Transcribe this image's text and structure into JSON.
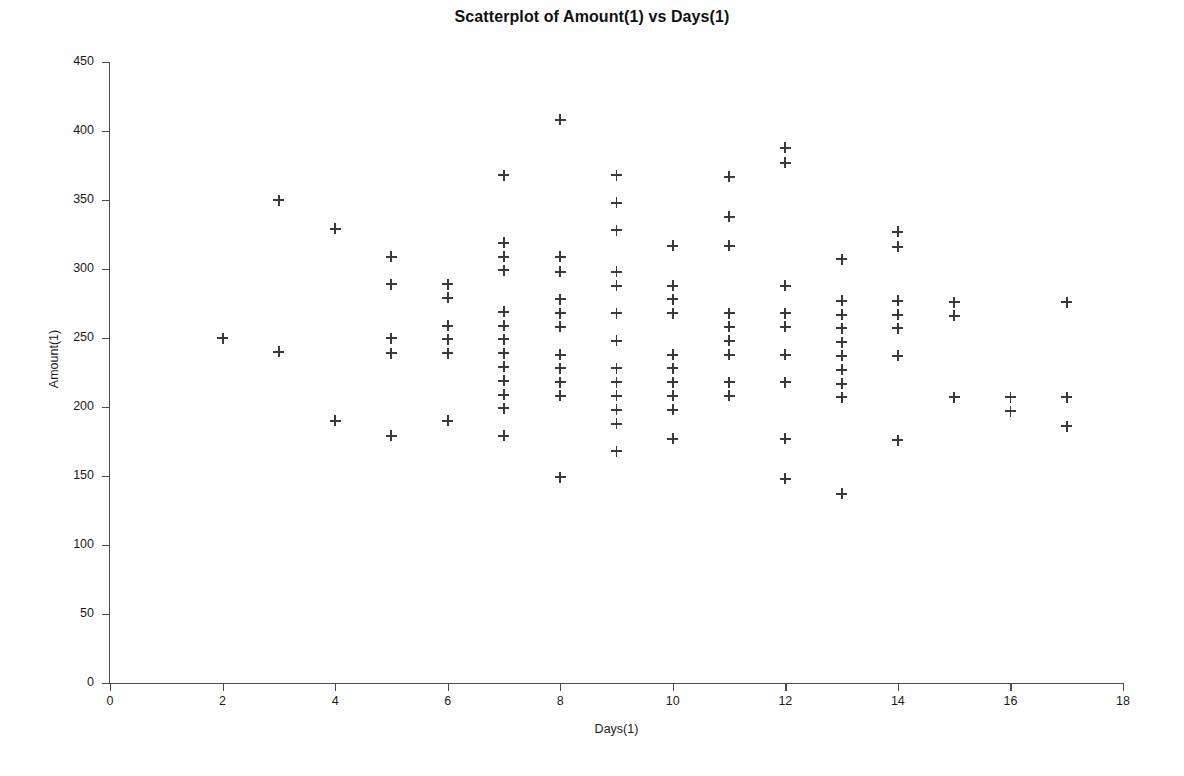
{
  "chart_data": {
    "type": "scatter",
    "title": "Scatterplot of Amount(1) vs Days(1)",
    "xlabel": "Days(1)",
    "ylabel": "Amount(1)",
    "xlim": [
      0,
      18
    ],
    "ylim": [
      0,
      450
    ],
    "xticks": [
      0,
      2,
      4,
      6,
      8,
      10,
      12,
      14,
      16,
      18
    ],
    "yticks": [
      0,
      50,
      100,
      150,
      200,
      250,
      300,
      350,
      400,
      450
    ],
    "grid": false,
    "legend": null,
    "marker": "plus",
    "marker_color": "#3a3a3a",
    "points": [
      {
        "x": 2,
        "y": 250
      },
      {
        "x": 3,
        "y": 350
      },
      {
        "x": 3,
        "y": 240
      },
      {
        "x": 4,
        "y": 329
      },
      {
        "x": 4,
        "y": 190
      },
      {
        "x": 5,
        "y": 309
      },
      {
        "x": 5,
        "y": 289
      },
      {
        "x": 5,
        "y": 250
      },
      {
        "x": 5,
        "y": 239
      },
      {
        "x": 5,
        "y": 179
      },
      {
        "x": 6,
        "y": 289
      },
      {
        "x": 6,
        "y": 279
      },
      {
        "x": 6,
        "y": 259
      },
      {
        "x": 6,
        "y": 249
      },
      {
        "x": 6,
        "y": 239
      },
      {
        "x": 6,
        "y": 190
      },
      {
        "x": 7,
        "y": 368
      },
      {
        "x": 7,
        "y": 319
      },
      {
        "x": 7,
        "y": 309
      },
      {
        "x": 7,
        "y": 299
      },
      {
        "x": 7,
        "y": 269
      },
      {
        "x": 7,
        "y": 259
      },
      {
        "x": 7,
        "y": 249
      },
      {
        "x": 7,
        "y": 239
      },
      {
        "x": 7,
        "y": 229
      },
      {
        "x": 7,
        "y": 219
      },
      {
        "x": 7,
        "y": 209
      },
      {
        "x": 7,
        "y": 199
      },
      {
        "x": 7,
        "y": 179
      },
      {
        "x": 8,
        "y": 408
      },
      {
        "x": 8,
        "y": 309
      },
      {
        "x": 8,
        "y": 298
      },
      {
        "x": 8,
        "y": 278
      },
      {
        "x": 8,
        "y": 268
      },
      {
        "x": 8,
        "y": 258
      },
      {
        "x": 8,
        "y": 238
      },
      {
        "x": 8,
        "y": 228
      },
      {
        "x": 8,
        "y": 218
      },
      {
        "x": 8,
        "y": 208
      },
      {
        "x": 8,
        "y": 149
      },
      {
        "x": 9,
        "y": 368
      },
      {
        "x": 9,
        "y": 348
      },
      {
        "x": 9,
        "y": 328
      },
      {
        "x": 9,
        "y": 298
      },
      {
        "x": 9,
        "y": 288
      },
      {
        "x": 9,
        "y": 268
      },
      {
        "x": 9,
        "y": 248
      },
      {
        "x": 9,
        "y": 228
      },
      {
        "x": 9,
        "y": 218
      },
      {
        "x": 9,
        "y": 208
      },
      {
        "x": 9,
        "y": 198
      },
      {
        "x": 9,
        "y": 188
      },
      {
        "x": 9,
        "y": 168
      },
      {
        "x": 10,
        "y": 317
      },
      {
        "x": 10,
        "y": 288
      },
      {
        "x": 10,
        "y": 278
      },
      {
        "x": 10,
        "y": 268
      },
      {
        "x": 10,
        "y": 238
      },
      {
        "x": 10,
        "y": 228
      },
      {
        "x": 10,
        "y": 218
      },
      {
        "x": 10,
        "y": 208
      },
      {
        "x": 10,
        "y": 198
      },
      {
        "x": 10,
        "y": 177
      },
      {
        "x": 11,
        "y": 367
      },
      {
        "x": 11,
        "y": 338
      },
      {
        "x": 11,
        "y": 317
      },
      {
        "x": 11,
        "y": 268
      },
      {
        "x": 11,
        "y": 258
      },
      {
        "x": 11,
        "y": 248
      },
      {
        "x": 11,
        "y": 238
      },
      {
        "x": 11,
        "y": 218
      },
      {
        "x": 11,
        "y": 208
      },
      {
        "x": 12,
        "y": 388
      },
      {
        "x": 12,
        "y": 377
      },
      {
        "x": 12,
        "y": 288
      },
      {
        "x": 12,
        "y": 268
      },
      {
        "x": 12,
        "y": 258
      },
      {
        "x": 12,
        "y": 238
      },
      {
        "x": 12,
        "y": 218
      },
      {
        "x": 12,
        "y": 177
      },
      {
        "x": 12,
        "y": 148
      },
      {
        "x": 13,
        "y": 307
      },
      {
        "x": 13,
        "y": 277
      },
      {
        "x": 13,
        "y": 267
      },
      {
        "x": 13,
        "y": 257
      },
      {
        "x": 13,
        "y": 247
      },
      {
        "x": 13,
        "y": 237
      },
      {
        "x": 13,
        "y": 227
      },
      {
        "x": 13,
        "y": 217
      },
      {
        "x": 13,
        "y": 207
      },
      {
        "x": 13,
        "y": 137
      },
      {
        "x": 14,
        "y": 327
      },
      {
        "x": 14,
        "y": 316
      },
      {
        "x": 14,
        "y": 277
      },
      {
        "x": 14,
        "y": 267
      },
      {
        "x": 14,
        "y": 257
      },
      {
        "x": 14,
        "y": 237
      },
      {
        "x": 14,
        "y": 176
      },
      {
        "x": 15,
        "y": 276
      },
      {
        "x": 15,
        "y": 266
      },
      {
        "x": 15,
        "y": 207
      },
      {
        "x": 16,
        "y": 207
      },
      {
        "x": 16,
        "y": 197
      },
      {
        "x": 17,
        "y": 276
      },
      {
        "x": 17,
        "y": 207
      },
      {
        "x": 17,
        "y": 186
      }
    ]
  }
}
